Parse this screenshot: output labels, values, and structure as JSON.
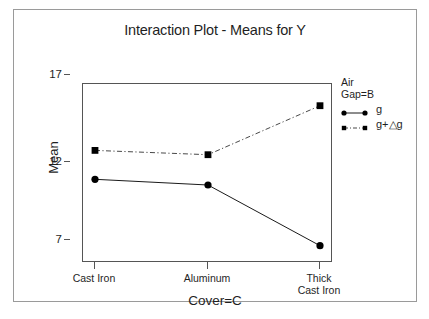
{
  "chart_data": {
    "type": "line",
    "title": "Interaction Plot - Means for Y",
    "xlabel": "Cover=C",
    "ylabel": "Mean",
    "categories": [
      "Cast Iron",
      "Aluminum",
      "Thick Cast Iron"
    ],
    "category_lines": [
      [
        "Cast Iron"
      ],
      [
        "Aluminum"
      ],
      [
        "Thick",
        "Cast Iron"
      ]
    ],
    "yticks": [
      17,
      12,
      7
    ],
    "ylim": [
      5.6,
      18.0
    ],
    "grid": false,
    "legend_position": "right",
    "legend_title": [
      "Air",
      "Gap=B"
    ],
    "series": [
      {
        "name": "g",
        "values": [
          11.4,
          11.0,
          6.8
        ],
        "line_style": "solid",
        "marker": "circle",
        "color": "#000000"
      },
      {
        "name": "g+△g",
        "values": [
          13.4,
          13.1,
          16.5
        ],
        "line_style": "dashed",
        "marker": "square",
        "color": "#000000"
      }
    ]
  },
  "chart": {
    "title": "Interaction Plot - Means for Y",
    "y_axis": {
      "label": "Mean",
      "ticks": [
        "17",
        "12",
        "7"
      ]
    },
    "x_axis": {
      "label": "Cover=C",
      "ticks": [
        {
          "line1": "Cast Iron",
          "line2": ""
        },
        {
          "line1": "Aluminum",
          "line2": ""
        },
        {
          "line1": "Thick",
          "line2": "Cast Iron"
        }
      ]
    },
    "legend": {
      "title_line1": "Air",
      "title_line2": "Gap=B",
      "entries": [
        {
          "label": "g",
          "style": "solid-circle"
        },
        {
          "label": "g+△g",
          "style": "dashed-square"
        }
      ]
    }
  }
}
